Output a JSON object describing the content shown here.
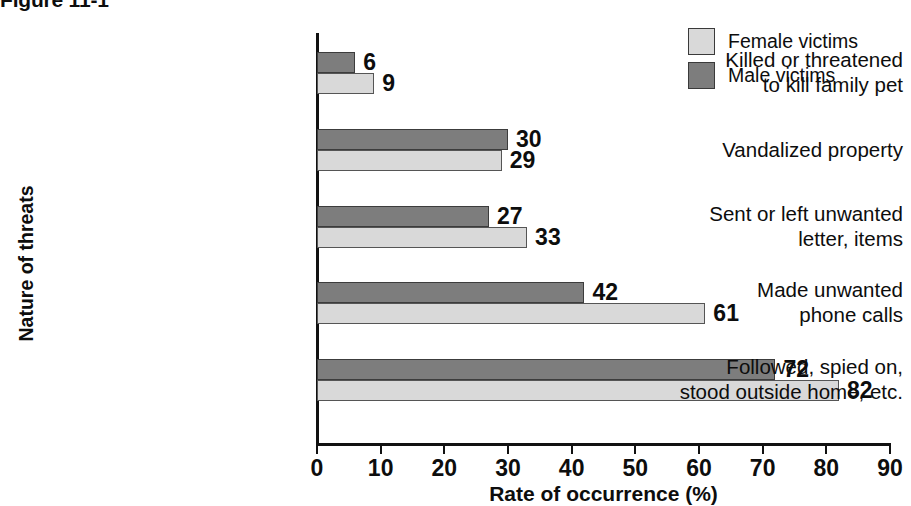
{
  "caption": {
    "label": "Figure 11-1",
    "text": "Five common stalking behaviors (clipped)"
  },
  "legend": {
    "position": "top-right",
    "items": [
      {
        "label": "Female victims",
        "color": "#d9d9d9",
        "series": "female"
      },
      {
        "label": "Male victims",
        "color": "#7d7d7d",
        "series": "male"
      }
    ]
  },
  "chart_data": {
    "type": "bar",
    "orientation": "horizontal",
    "xlabel": "Rate of occurrence (%)",
    "ylabel": "Nature of threats",
    "xlim": [
      0,
      90
    ],
    "xticks": [
      0,
      10,
      20,
      30,
      40,
      50,
      60,
      70,
      80,
      90
    ],
    "xtick_labels": [
      "0",
      "10",
      "20",
      "30",
      "40",
      "50",
      "60",
      "70",
      "80",
      "90"
    ],
    "grid": false,
    "legend_position": "top-right",
    "categories": [
      "Killed or threatened\nto kill family pet",
      "Vandalized property",
      "Sent or left unwanted\nletter, items",
      "Made unwanted\nphone calls",
      "Followed, spied on,\nstood outside home, etc."
    ],
    "category_lines": [
      [
        "Killed or threatened",
        "to kill family pet"
      ],
      [
        "Vandalized property"
      ],
      [
        "Sent or left unwanted",
        "letter, items"
      ],
      [
        "Made unwanted",
        "phone calls"
      ],
      [
        "Followed, spied on,",
        "stood outside home, etc."
      ]
    ],
    "series": [
      {
        "name": "Male victims",
        "key": "male",
        "color": "#7d7d7d",
        "values": [
          6,
          30,
          27,
          42,
          72
        ]
      },
      {
        "name": "Female victims",
        "key": "female",
        "color": "#d9d9d9",
        "values": [
          9,
          29,
          33,
          61,
          82
        ]
      }
    ]
  },
  "axis": {
    "x_title": "Rate of occurrence (%)",
    "y_title": "Nature of threats"
  }
}
